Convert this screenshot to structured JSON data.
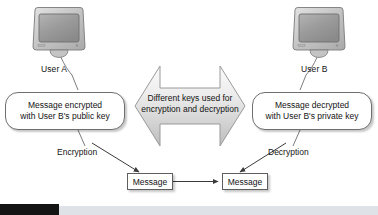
{
  "diagram": {
    "colors": {
      "line": "#5e5e5e",
      "text": "#131313",
      "arrow_fill_light": "#f2f2f2",
      "arrow_fill_dark": "#c8c8c8",
      "monitor_body": "#c9c9c9",
      "monitor_screen": "#9a9a9a",
      "bar_dark": "#141414",
      "bar_light": "#dfe2e6"
    },
    "nodes": {
      "user_a": {
        "label": "User A",
        "icon": "crt-monitor-icon"
      },
      "user_b": {
        "label": "User B",
        "icon": "crt-monitor-icon"
      },
      "left_callout": {
        "line1": "Message encrypted",
        "line2": "with User B's public key"
      },
      "right_callout": {
        "line1": "Message decrypted",
        "line2": "with User B's private key"
      },
      "center_arrow": {
        "line1": "Different keys used for",
        "line2": "encryption and decryption",
        "icon": "double-headed-arrow-icon"
      },
      "message_left": {
        "label": "Message"
      },
      "message_right": {
        "label": "Message"
      }
    },
    "edge_labels": {
      "encryption": "Encryption",
      "decryption": "Decryption"
    }
  }
}
